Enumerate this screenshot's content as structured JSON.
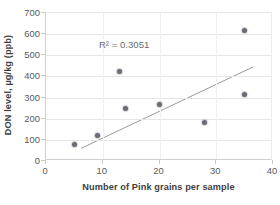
{
  "chart_data": {
    "type": "scatter",
    "title": "",
    "xlabel": "Number of Pink grains per sample",
    "ylabel": "DON level,  µg/kg  (ppb)",
    "xlim": [
      0,
      40
    ],
    "ylim": [
      0,
      700
    ],
    "xticks": [
      0,
      10,
      20,
      30,
      40
    ],
    "yticks": [
      0,
      100,
      200,
      300,
      400,
      500,
      600,
      700
    ],
    "xtick_labels": [
      "0",
      "10",
      "20",
      "30",
      "40"
    ],
    "ytick_labels": [
      "0",
      "100",
      "200",
      "300",
      "400",
      "500",
      "600",
      "700"
    ],
    "grid": "horizontal",
    "legend": "none",
    "annotations": [
      {
        "name": "r-squared",
        "text": "R² = 0.3051",
        "x": 9.5,
        "y": 545
      }
    ],
    "series": [
      {
        "name": "DON level vs pink grains",
        "marker": "circle",
        "color": "#6b6b75",
        "points": [
          {
            "x": 5,
            "y": 80
          },
          {
            "x": 9,
            "y": 120
          },
          {
            "x": 13,
            "y": 425
          },
          {
            "x": 14,
            "y": 250
          },
          {
            "x": 20,
            "y": 265
          },
          {
            "x": 28,
            "y": 180
          },
          {
            "x": 35,
            "y": 315
          },
          {
            "x": 35,
            "y": 615
          }
        ]
      }
    ],
    "trendline": {
      "name": "linear-trendline",
      "color": "#9a9a9a",
      "r_squared": 0.3051,
      "x_start": 6.2,
      "y_start": 60,
      "x_end": 36.5,
      "y_end": 445
    },
    "colors": {
      "marker": "#6b6b75",
      "trendline": "#9a9a9a",
      "gridline": "#e6e6e6",
      "axis": "#d0d0d0",
      "tick_label": "#595959",
      "axis_title": "#3f3f3f",
      "annotation": "#6b6b6b",
      "background": "#ffffff"
    }
  }
}
